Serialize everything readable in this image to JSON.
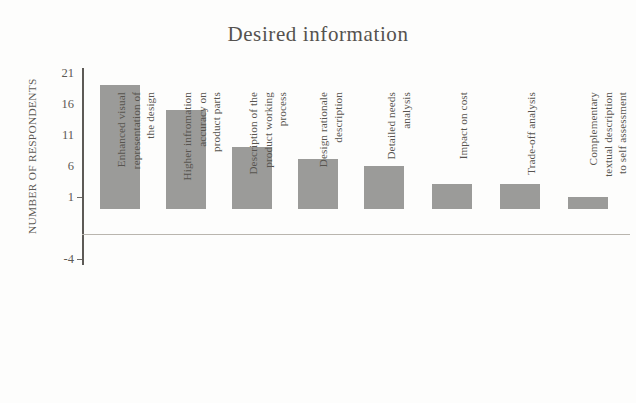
{
  "chart_data": {
    "type": "bar",
    "title": "Desired information",
    "xlabel": "",
    "ylabel": "NUMBER OF RESPONDENTS",
    "ylim": [
      -4,
      21
    ],
    "yticks": [
      -4,
      1,
      6,
      11,
      16,
      21
    ],
    "ytick_labels": [
      "-4",
      "1",
      "6",
      "11",
      "16",
      "21"
    ],
    "grid": false,
    "legend": null,
    "bar_color": "#9b9b99",
    "categories": [
      "Enhanced visual\nrepresentation of\nthe design",
      "Higher infromation\naccuracy on\nproduct parts",
      "Description of the\nproduct working\nprocess",
      "Design rationale\ndescription",
      "Detailed needs\nanalysis",
      "Impact on cost",
      "Trade-off analysis",
      "Complementary\ntextual description\nto self assessment"
    ],
    "values": [
      20,
      16,
      10,
      8,
      7,
      4,
      4,
      2
    ]
  },
  "axis": {
    "y_title": "NUMBER OF RESPONDENTS",
    "ticks": [
      "21",
      "16",
      "11",
      "6",
      "1",
      "-4"
    ]
  }
}
